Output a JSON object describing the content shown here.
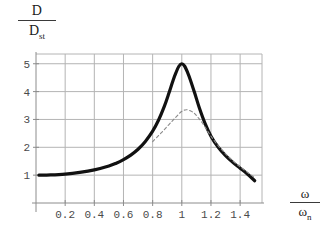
{
  "figure": {
    "background": "#ffffff",
    "axis_color": "#8c8c8c",
    "grid_color": "#b4b4b4",
    "solid_curve_color": "#111111",
    "dashed_curve_color": "#8a8a8a"
  },
  "labels": {
    "y_numerator": "D",
    "y_denominator_main": "D",
    "y_denominator_sub": "st",
    "x_numerator": "ω",
    "x_denominator_main": "ω",
    "x_denominator_sub": "n"
  },
  "chart_data": {
    "type": "line",
    "title": "",
    "xlabel": "ω/ωn",
    "ylabel": "D/Dst",
    "xlim": [
      0,
      1.55
    ],
    "ylim": [
      0,
      5.35
    ],
    "grid": true,
    "legend": "none",
    "x_ticks": [
      0.2,
      0.4,
      0.6,
      0.8,
      1,
      1.2,
      1.4
    ],
    "x_tick_labels": [
      "0.2",
      "0.4",
      "0.6",
      "0.8",
      "1",
      "1.2",
      "1.4"
    ],
    "y_ticks": [
      1,
      2,
      3,
      4,
      5
    ],
    "y_tick_labels": [
      "1",
      "2",
      "3",
      "4",
      "5"
    ],
    "series": [
      {
        "name": "light damping",
        "style": "solid",
        "width": 3.2,
        "color": "#111111",
        "peak_x": 1.0,
        "peak_y": 5.0,
        "x": [
          0.02,
          0.1,
          0.2,
          0.3,
          0.4,
          0.5,
          0.55,
          0.6,
          0.65,
          0.7,
          0.75,
          0.8,
          0.84,
          0.88,
          0.91,
          0.94,
          0.96,
          0.98,
          1.0,
          1.02,
          1.04,
          1.06,
          1.09,
          1.12,
          1.16,
          1.2,
          1.25,
          1.3,
          1.35,
          1.4,
          1.45,
          1.5
        ],
        "y": [
          1.0,
          1.01,
          1.04,
          1.1,
          1.19,
          1.33,
          1.43,
          1.56,
          1.72,
          1.93,
          2.21,
          2.58,
          2.97,
          3.47,
          3.92,
          4.4,
          4.68,
          4.91,
          5.0,
          4.91,
          4.68,
          4.4,
          3.92,
          3.42,
          2.85,
          2.4,
          2.0,
          1.7,
          1.46,
          1.25,
          1.04,
          0.8
        ]
      },
      {
        "name": "heavier damping",
        "style": "dashed",
        "width": 1.1,
        "color": "#8a8a8a",
        "peak_x": 1.03,
        "peak_y": 3.35,
        "x": [
          0.8,
          0.84,
          0.87,
          0.9,
          0.93,
          0.95,
          0.97,
          0.99,
          1.01,
          1.03,
          1.05,
          1.07,
          1.09,
          1.11,
          1.14,
          1.17,
          1.2,
          1.24,
          1.28,
          1.32,
          1.37,
          1.42,
          1.47,
          1.5
        ],
        "y": [
          2.2,
          2.42,
          2.58,
          2.75,
          2.92,
          3.03,
          3.14,
          3.25,
          3.32,
          3.35,
          3.33,
          3.28,
          3.2,
          3.08,
          2.88,
          2.64,
          2.4,
          2.12,
          1.88,
          1.66,
          1.42,
          1.22,
          1.02,
          0.92
        ]
      }
    ]
  }
}
